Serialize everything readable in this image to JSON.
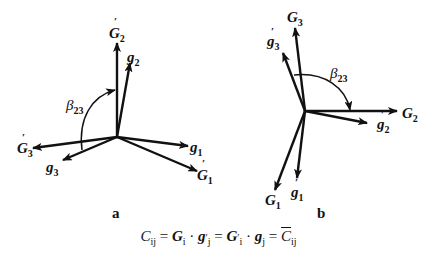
{
  "diagram_a": {
    "panel_label": "a",
    "vectors": [
      {
        "name": "G2_prime",
        "label": "G",
        "sub": "2",
        "prime": true
      },
      {
        "name": "g2",
        "label": "g",
        "sub": "2",
        "prime": false
      },
      {
        "name": "G3_prime",
        "label": "G",
        "sub": "3",
        "prime": true
      },
      {
        "name": "g3",
        "label": "g",
        "sub": "3",
        "prime": false
      },
      {
        "name": "g1",
        "label": "g",
        "sub": "1",
        "prime": false
      },
      {
        "name": "G1_prime",
        "label": "G",
        "sub": "1",
        "prime": true
      }
    ],
    "angle": {
      "symbol": "β",
      "sub": "23"
    }
  },
  "diagram_b": {
    "panel_label": "b",
    "vectors": [
      {
        "name": "G3",
        "label": "G",
        "sub": "3",
        "prime": false
      },
      {
        "name": "g3_prime",
        "label": "g",
        "sub": "3",
        "prime": true
      },
      {
        "name": "G2",
        "label": "G",
        "sub": "2",
        "prime": false
      },
      {
        "name": "g2_prime",
        "label": "g",
        "sub": "2",
        "prime": true
      },
      {
        "name": "G1",
        "label": "G",
        "sub": "1",
        "prime": false
      },
      {
        "name": "g1_prime",
        "label": "g",
        "sub": "1",
        "prime": true
      }
    ],
    "angle": {
      "symbol": "β",
      "sub": "23"
    }
  },
  "formula": {
    "C": "C",
    "ij": "ij",
    "eq": " = ",
    "G": "G",
    "i": "i",
    "dot": " · ",
    "g": "g",
    "j": "j",
    "prime": "′"
  }
}
